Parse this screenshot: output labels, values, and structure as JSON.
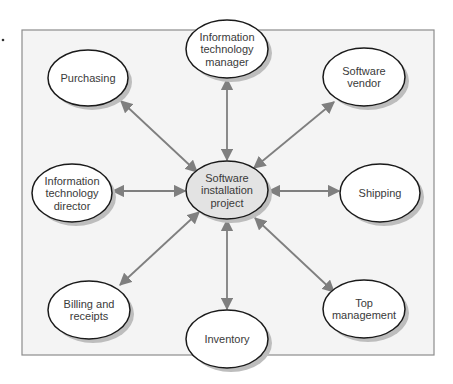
{
  "diagram": {
    "type": "hub-and-spoke",
    "frame": {
      "x": 22,
      "y": 30,
      "width": 412,
      "height": 325,
      "fill": "#f4f4f4",
      "stroke": "#8c8c8c"
    },
    "marker_dot": {
      "x": 3,
      "y": 40
    },
    "colors": {
      "arrow": "#7f7f7f",
      "node_fill": "#ffffff",
      "hub_fill": "#e3e3e3",
      "node_stroke": "#1a1a1a",
      "shadow": "#bdbdbd",
      "text": "#3a3a3a"
    },
    "hub": {
      "id": "software-installation-project",
      "lines": [
        "Software",
        "installation",
        "project"
      ],
      "cx": 227,
      "cy": 190,
      "rx": 41,
      "ry": 29
    },
    "nodes": [
      {
        "id": "it-manager",
        "lines": [
          "Information",
          "technology",
          "manager"
        ],
        "cx": 227,
        "cy": 49,
        "rx": 41,
        "ry": 29
      },
      {
        "id": "purchasing",
        "lines": [
          "Purchasing"
        ],
        "cx": 88,
        "cy": 78,
        "rx": 40,
        "ry": 28
      },
      {
        "id": "software-vendor",
        "lines": [
          "Software",
          "vendor"
        ],
        "cx": 364,
        "cy": 77,
        "rx": 41,
        "ry": 29
      },
      {
        "id": "it-director",
        "lines": [
          "Information",
          "technology",
          "director"
        ],
        "cx": 72,
        "cy": 193,
        "rx": 40,
        "ry": 29
      },
      {
        "id": "shipping",
        "lines": [
          "Shipping"
        ],
        "cx": 380,
        "cy": 193,
        "rx": 40,
        "ry": 29
      },
      {
        "id": "billing-and-receipts",
        "lines": [
          "Billing and",
          "receipts"
        ],
        "cx": 89,
        "cy": 310,
        "rx": 41,
        "ry": 29
      },
      {
        "id": "inventory",
        "lines": [
          "Inventory"
        ],
        "cx": 227,
        "cy": 339,
        "rx": 41,
        "ry": 29
      },
      {
        "id": "top-management",
        "lines": [
          "Top",
          "management"
        ],
        "cx": 364,
        "cy": 309,
        "rx": 41,
        "ry": 29
      }
    ],
    "edges": [
      {
        "to": "it-manager",
        "x1": 227,
        "y1": 160,
        "x2": 227,
        "y2": 79
      },
      {
        "to": "purchasing",
        "x1": 197,
        "y1": 172,
        "x2": 121,
        "y2": 101
      },
      {
        "to": "software-vendor",
        "x1": 254,
        "y1": 168,
        "x2": 334,
        "y2": 102
      },
      {
        "to": "it-director",
        "x1": 185,
        "y1": 191,
        "x2": 113,
        "y2": 191
      },
      {
        "to": "shipping",
        "x1": 269,
        "y1": 191,
        "x2": 339,
        "y2": 191
      },
      {
        "to": "billing-and-receipts",
        "x1": 199,
        "y1": 212,
        "x2": 120,
        "y2": 285
      },
      {
        "to": "inventory",
        "x1": 227,
        "y1": 220,
        "x2": 227,
        "y2": 309
      },
      {
        "to": "top-management",
        "x1": 255,
        "y1": 218,
        "x2": 334,
        "y2": 292
      }
    ]
  }
}
